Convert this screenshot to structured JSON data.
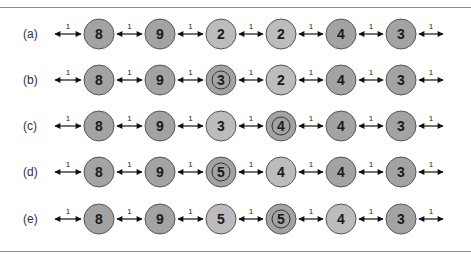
{
  "colors": {
    "dark_node": "#a3a3a3",
    "light_node": "#bcbcbc",
    "stroke": "#555555",
    "arrow": "#111111",
    "rule": "#8a8a8a"
  },
  "edge_weight": "1",
  "rows": [
    {
      "label": "(a)",
      "nodes": [
        {
          "value": "8",
          "shade": "dark",
          "ring": false
        },
        {
          "value": "9",
          "shade": "dark",
          "ring": false
        },
        {
          "value": "2",
          "shade": "light",
          "ring": false
        },
        {
          "value": "2",
          "shade": "light",
          "ring": false
        },
        {
          "value": "4",
          "shade": "dark",
          "ring": false
        },
        {
          "value": "3",
          "shade": "dark",
          "ring": false
        }
      ]
    },
    {
      "label": "(b)",
      "nodes": [
        {
          "value": "8",
          "shade": "dark",
          "ring": false
        },
        {
          "value": "9",
          "shade": "dark",
          "ring": false
        },
        {
          "value": "3",
          "shade": "dark",
          "ring": true
        },
        {
          "value": "2",
          "shade": "light",
          "ring": false
        },
        {
          "value": "4",
          "shade": "dark",
          "ring": false
        },
        {
          "value": "3",
          "shade": "dark",
          "ring": false
        }
      ]
    },
    {
      "label": "(c)",
      "nodes": [
        {
          "value": "8",
          "shade": "dark",
          "ring": false
        },
        {
          "value": "9",
          "shade": "dark",
          "ring": false
        },
        {
          "value": "3",
          "shade": "light",
          "ring": false
        },
        {
          "value": "4",
          "shade": "dark",
          "ring": true
        },
        {
          "value": "4",
          "shade": "dark",
          "ring": false
        },
        {
          "value": "3",
          "shade": "dark",
          "ring": false
        }
      ]
    },
    {
      "label": "(d)",
      "nodes": [
        {
          "value": "8",
          "shade": "dark",
          "ring": false
        },
        {
          "value": "9",
          "shade": "dark",
          "ring": false
        },
        {
          "value": "5",
          "shade": "dark",
          "ring": true
        },
        {
          "value": "4",
          "shade": "light",
          "ring": false
        },
        {
          "value": "4",
          "shade": "dark",
          "ring": false
        },
        {
          "value": "3",
          "shade": "dark",
          "ring": false
        }
      ]
    },
    {
      "label": "(e)",
      "nodes": [
        {
          "value": "8",
          "shade": "dark",
          "ring": false
        },
        {
          "value": "9",
          "shade": "dark",
          "ring": false
        },
        {
          "value": "5",
          "shade": "light",
          "ring": false
        },
        {
          "value": "5",
          "shade": "dark",
          "ring": true
        },
        {
          "value": "4",
          "shade": "light",
          "ring": false
        },
        {
          "value": "3",
          "shade": "dark",
          "ring": false
        }
      ]
    }
  ]
}
